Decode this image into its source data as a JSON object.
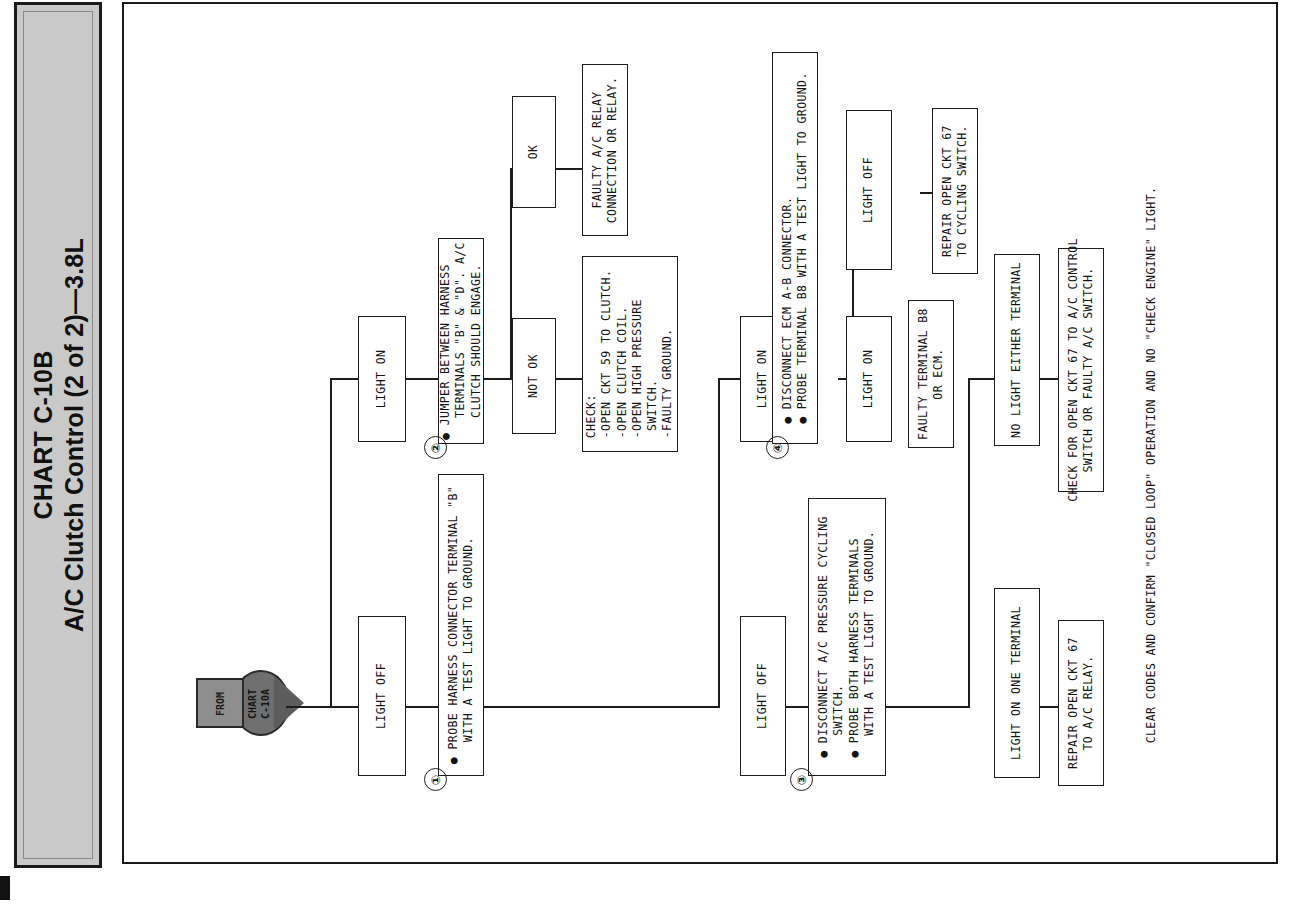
{
  "title": {
    "line1": "CHART C-10B",
    "line2": "A/C Clutch Control (2 of 2)—3.8L"
  },
  "start_node": {
    "label_left": "FROM",
    "label_right": "CHART\nC-10A"
  },
  "steps": {
    "one": "①",
    "two": "②",
    "three": "③",
    "four": "④"
  },
  "boxes": {
    "step1": "● PROBE HARNESS CONNECTOR TERMINAL \"B\"\n   WITH A TEST LIGHT TO GROUND.",
    "light_off_1": "LIGHT OFF",
    "light_on_1": "LIGHT ON",
    "step2": "● JUMPER BETWEEN HARNESS\n   TERMINALS \"B\" & \"D\". A/C\n   CLUTCH SHOULD ENGAGE.",
    "ok": "OK",
    "not_ok": "NOT OK",
    "faulty_relay": "FAULTY A/C RELAY\nCONNECTION OR RELAY.",
    "check_list": "CHECK:\n-OPEN CKT 59 TO CLUTCH.\n-OPEN CLUTCH COIL.\n-OPEN HIGH PRESSURE\n SWITCH.\n-FAULTY GROUND.",
    "light_on_2": "LIGHT ON",
    "light_off_2": "LIGHT OFF",
    "step4": "● DISCONNECT ECM A-B CONNECTOR.\n● PROBE TERMINAL B8 WITH A TEST LIGHT TO GROUND.",
    "light_off_3": "LIGHT OFF",
    "repair_67_cycling": "REPAIR OPEN CKT 67\nTO CYCLING SWITCH.",
    "light_on_3": "LIGHT ON",
    "faulty_b8": "FAULTY TERMINAL B8\nOR ECM.",
    "step3": "● DISCONNECT A/C PRESSURE CYCLING\n   SWITCH.\n● PROBE BOTH HARNESS TERMINALS\n   WITH A TEST LIGHT TO GROUND.",
    "no_light_either": "NO LIGHT EITHER TERMINAL",
    "check_67_control": "CHECK FOR OPEN CKT 67 TO A/C CONTROL\nSWITCH OR FAULTY A/C SWITCH.",
    "light_on_one": "LIGHT ON ONE TERMINAL",
    "repair_67_relay": "REPAIR OPEN CKT 67\nTO A/C RELAY."
  },
  "footer": {
    "note": "CLEAR CODES AND CONFIRM \"CLOSED LOOP\" OPERATION AND NO \"CHECK ENGINE\" LIGHT."
  },
  "colors": {
    "ink": "#1d1d1d",
    "band": "#c9c9c9",
    "node": "#6f6f6f"
  }
}
